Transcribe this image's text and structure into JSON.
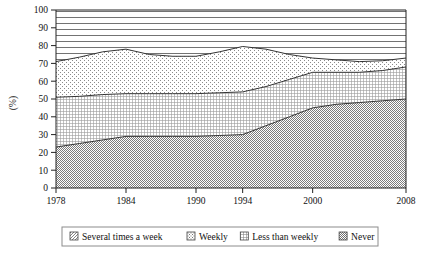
{
  "chart_data": {
    "type": "area",
    "title": "",
    "subtitle": "",
    "xlabel": "",
    "ylabel": "(%)",
    "stacked": true,
    "grid": false,
    "legend_position": "bottom",
    "xlim": [
      1978,
      2008
    ],
    "ylim": [
      0,
      100
    ],
    "x_tick_labels": [
      "1978",
      "1984",
      "1990",
      "1994",
      "2000",
      "2008"
    ],
    "x_ticks": [
      1978,
      1984,
      1990,
      1994,
      2000,
      2008
    ],
    "y_tick_labels": [
      "0",
      "10",
      "20",
      "30",
      "40",
      "50",
      "60",
      "70",
      "80",
      "90",
      "100"
    ],
    "y_ticks": [
      0,
      10,
      20,
      30,
      40,
      50,
      60,
      70,
      80,
      90,
      100
    ],
    "x": [
      1978,
      1980,
      1982,
      1984,
      1986,
      1988,
      1990,
      1992,
      1994,
      1996,
      1998,
      2000,
      2002,
      2004,
      2006,
      2008
    ],
    "series": [
      {
        "name": "Never",
        "order": 1,
        "pattern": "checker-dense",
        "values": [
          23,
          25,
          27,
          29,
          29,
          29,
          29,
          29.5,
          30,
          35,
          40,
          45,
          47,
          48,
          49,
          50
        ]
      },
      {
        "name": "Less than weekly",
        "order": 2,
        "pattern": "grid-fine",
        "values": [
          28,
          26.5,
          25.5,
          24,
          24,
          24,
          24,
          24,
          24,
          22,
          21,
          20,
          18,
          17,
          17,
          18
        ]
      },
      {
        "name": "Weekly",
        "order": 3,
        "pattern": "dots-sparse",
        "values": [
          20,
          22,
          24,
          25,
          22,
          21,
          21,
          23,
          25.5,
          21,
          14,
          8,
          7,
          6,
          5.5,
          5
        ]
      },
      {
        "name": "Several times a week",
        "order": 4,
        "pattern": "horizontal-lines",
        "values": [
          29,
          26.5,
          23.5,
          22,
          25,
          26,
          26,
          23.5,
          20.5,
          22,
          25,
          27,
          28,
          29,
          28.5,
          27
        ]
      }
    ],
    "cumulative_boundaries": {
      "never_top": [
        23,
        25,
        27,
        29,
        29,
        29,
        29,
        29.5,
        30,
        35,
        40,
        45,
        47,
        48,
        49,
        50
      ],
      "less_than_weekly_top": [
        51,
        51.5,
        52.5,
        53,
        53,
        53,
        53,
        53.5,
        54,
        57,
        61,
        65,
        65,
        65,
        66,
        68
      ],
      "weekly_top": [
        71,
        73.5,
        76.5,
        78,
        75,
        74,
        74,
        76.5,
        79.5,
        78,
        75,
        73,
        72,
        71,
        71.5,
        73
      ],
      "top": [
        100,
        100,
        100,
        100,
        100,
        100,
        100,
        100,
        100,
        100,
        100,
        100,
        100,
        100,
        100,
        100
      ]
    }
  },
  "legend": {
    "items": [
      {
        "label": "Several times a week",
        "swatch": "swatch-several-times-a-week"
      },
      {
        "label": "Weekly",
        "swatch": "swatch-weekly"
      },
      {
        "label": "Less than weekly",
        "swatch": "swatch-less-than-weekly"
      },
      {
        "label": "Never",
        "swatch": "swatch-never"
      }
    ]
  },
  "colors": {
    "axis": "#222222",
    "line": "#333333",
    "pattern_fg": "#6b6b6b",
    "background": "#ffffff",
    "legend_border": "#8c8c8c"
  }
}
